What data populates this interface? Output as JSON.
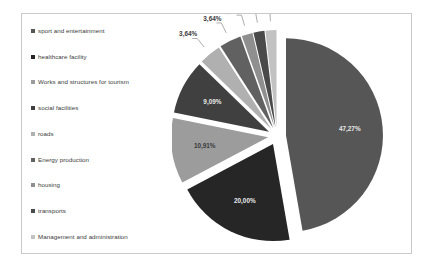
{
  "chart_data": {
    "type": "pie",
    "title": "",
    "legend_position": "left",
    "categories": [
      "sport and entertainment",
      "healthcare facility",
      "Works and structures for tourism",
      "social facilities",
      "roads",
      "Energy production",
      "housing",
      "transports",
      "Management and administration"
    ],
    "values": [
      47.27,
      20.0,
      10.91,
      9.09,
      3.64,
      3.64,
      1.82,
      1.82,
      1.82
    ],
    "labels": [
      "47,27%",
      "20,00%",
      "10,91%",
      "9,09%",
      "3,64%",
      "3,64%",
      "1,82%",
      "1,82%",
      "1,82%"
    ],
    "colors": [
      "#565656",
      "#262626",
      "#9c9c9c",
      "#404040",
      "#b0b0b0",
      "#616161",
      "#8f8f8f",
      "#4a4a4a",
      "#c2c2c2"
    ],
    "exploded": true,
    "total": "100%"
  },
  "legend": {
    "items": [
      {
        "label": "sport and entertainment",
        "color": "#565656"
      },
      {
        "label": "healthcare facility",
        "color": "#262626"
      },
      {
        "label": "Works and structures for tourism",
        "color": "#9c9c9c"
      },
      {
        "label": "social facilities",
        "color": "#404040"
      },
      {
        "label": "roads",
        "color": "#b0b0b0"
      },
      {
        "label": "Energy production",
        "color": "#616161"
      },
      {
        "label": "housing",
        "color": "#8f8f8f"
      },
      {
        "label": "transports",
        "color": "#4a4a4a"
      },
      {
        "label": "Management and administration",
        "color": "#c2c2c2"
      }
    ]
  },
  "slice_labels": {
    "s0": "47,27%",
    "s1": "20,00%",
    "s2": "10,91%",
    "s3": "9,09%",
    "s4": "3,64%",
    "s5": "3,64%",
    "s6": "1,82%",
    "s7": "1,82%",
    "s8": "1,82%"
  }
}
